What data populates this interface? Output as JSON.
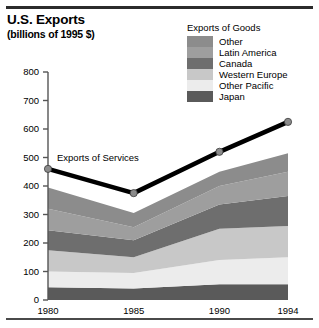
{
  "title": "U.S. Exports",
  "subtitle": "(billions of 1995 $)",
  "legend": {
    "title": "Exports of Goods",
    "items": [
      {
        "label": "Other",
        "color": "#8c8c8c"
      },
      {
        "label": "Latin America",
        "color": "#9e9e9e"
      },
      {
        "label": "Canada",
        "color": "#6e6e6e"
      },
      {
        "label": "Western Europe",
        "color": "#c8c8c8"
      },
      {
        "label": "Other Pacific",
        "color": "#ececec"
      },
      {
        "label": "Japan",
        "color": "#5a5a5a"
      }
    ]
  },
  "annotations": {
    "services_label": "Exports of Services"
  },
  "chart_data": {
    "type": "area",
    "title": "U.S. Exports",
    "subtitle": "(billions of 1995 $)",
    "xlabel": "",
    "ylabel": "",
    "x": [
      1980,
      1985,
      1990,
      1994
    ],
    "categories": [
      "1980",
      "1985",
      "1990",
      "1994"
    ],
    "xtick_labels": [
      "1980",
      "1985",
      "1990",
      "1994"
    ],
    "ytick_labels": [
      "0",
      "100",
      "200",
      "300",
      "400",
      "500",
      "600",
      "700",
      "800"
    ],
    "ylim": [
      0,
      800
    ],
    "ytick_step": 100,
    "grid": false,
    "legend_position": "top-right",
    "stacked": true,
    "stack_order_bottom_to_top": [
      "Japan",
      "Other Pacific",
      "Western Europe",
      "Canada",
      "Latin America",
      "Other"
    ],
    "series": [
      {
        "name": "Japan",
        "color": "#5a5a5a",
        "values": [
          45,
          40,
          55,
          55
        ]
      },
      {
        "name": "Other Pacific",
        "color": "#ececec",
        "values": [
          55,
          55,
          85,
          95
        ]
      },
      {
        "name": "Western Europe",
        "color": "#c8c8c8",
        "values": [
          75,
          55,
          110,
          110
        ]
      },
      {
        "name": "Canada",
        "color": "#6e6e6e",
        "values": [
          70,
          60,
          85,
          105
        ]
      },
      {
        "name": "Latin America",
        "color": "#9e9e9e",
        "values": [
          75,
          45,
          65,
          85
        ]
      },
      {
        "name": "Other",
        "color": "#8c8c8c",
        "values": [
          75,
          50,
          50,
          65
        ]
      }
    ],
    "stack_totals": [
      395,
      305,
      450,
      515
    ],
    "overlay_series": [
      {
        "name": "Exports of Services",
        "type": "line",
        "color": "#000000",
        "marker": "circle",
        "marker_color": "#8c8c8c",
        "values": [
          460,
          375,
          520,
          625
        ]
      }
    ]
  }
}
